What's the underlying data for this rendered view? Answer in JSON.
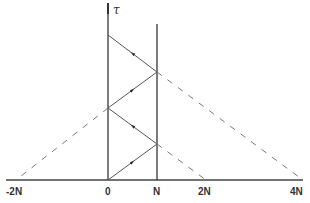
{
  "diagram": {
    "axis_label": "τ",
    "x_labels": [
      {
        "text": "-2N",
        "x": 14
      },
      {
        "text": "0",
        "x": 108
      },
      {
        "text": "N",
        "x": 157
      },
      {
        "text": "2N",
        "x": 206
      },
      {
        "text": "4N",
        "x": 296
      }
    ],
    "colors": {
      "line": "#444444",
      "dashed": "#777777",
      "background": "#ffffff"
    }
  }
}
